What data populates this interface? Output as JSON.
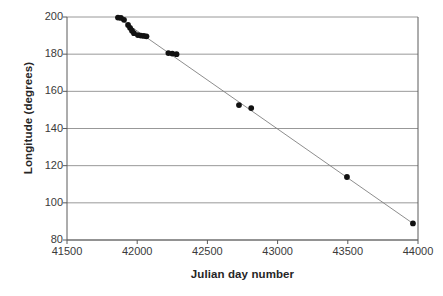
{
  "chart_data": {
    "type": "scatter",
    "title": "",
    "subtitle": "",
    "xlabel": "Julian day number",
    "ylabel": "Longitude (degrees)",
    "xlim": [
      41500,
      44000
    ],
    "ylim": [
      80,
      200
    ],
    "xticks": [
      41500,
      42000,
      42500,
      43000,
      43500,
      44000
    ],
    "yticks": [
      80,
      100,
      120,
      140,
      160,
      180,
      200
    ],
    "xtick_labels": [
      "41500",
      "42000",
      "42500",
      "43000",
      "43500",
      "44000"
    ],
    "ytick_labels": [
      "80",
      "100",
      "120",
      "140",
      "160",
      "180",
      "200"
    ],
    "grid": "horizontal",
    "legend": null,
    "legend_position": "none",
    "marker": "filled-circle",
    "marker_color": "#111111",
    "marker_size": 4.6,
    "line_color": "#808080",
    "line_width": 0.9,
    "series": [
      {
        "name": "Longitude vs Julian day",
        "x": [
          41863,
          41884,
          41906,
          41935,
          41949,
          41963,
          41977,
          42005,
          42026,
          42047,
          42066,
          42222,
          42250,
          42280,
          42725,
          42812,
          43494,
          43964
        ],
        "y": [
          199.7,
          199.5,
          198.5,
          195.7,
          194.2,
          192.6,
          191.3,
          190.3,
          190.0,
          189.8,
          189.6,
          180.6,
          180.3,
          180.0,
          152.6,
          151.0,
          113.9,
          88.9
        ]
      }
    ],
    "trendline": {
      "type": "linear",
      "x": [
        41863,
        43964
      ],
      "y": [
        199.7,
        88.9
      ]
    }
  },
  "axes": {
    "y_title": "Longitude (degrees)",
    "x_title": "Julian day number"
  }
}
